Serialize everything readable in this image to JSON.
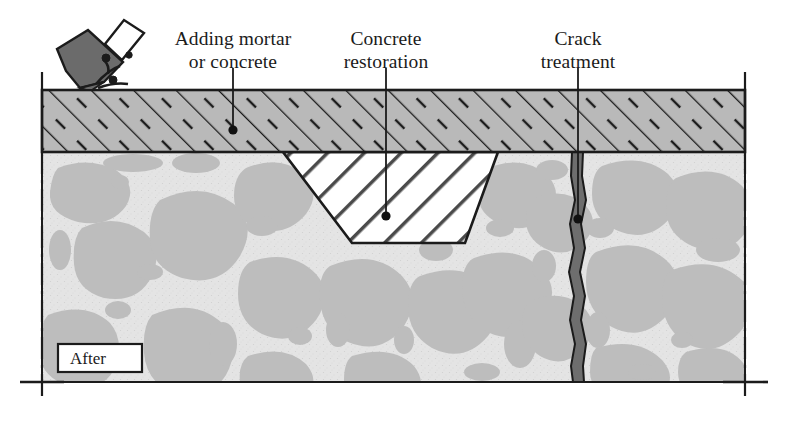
{
  "figure": {
    "stage_width": 787,
    "stage_height": 421
  },
  "labels": {
    "mortar": {
      "line1": "Adding mortar",
      "line2": "or concrete"
    },
    "restoration": {
      "line1": "Concrete",
      "line2": "restoration"
    },
    "crack": {
      "line1": "Crack",
      "line2": "treatment"
    },
    "stage_badge": "After"
  },
  "colors": {
    "outline": "#1b1b1b",
    "mortar_fill": "#b9b9b9",
    "concrete_matrix": "#e2e2e2",
    "aggregate": "#bdbdbd",
    "patch_fill": "#ffffff",
    "patch_hatch": "#4a4a4a",
    "crack_fill": "#6e6e6e",
    "tool_head": "#6b6b6b",
    "tool_handle": "#ffffff",
    "badge_bg": "#ffffff"
  },
  "geometry": {
    "section_left": 42,
    "section_right": 745,
    "surface_y": 90,
    "mortar_bottom_y": 152,
    "base_bottom_y": 382,
    "patch_top_left_x": 283,
    "patch_top_right_x": 498,
    "patch_bottom_left_x": 352,
    "patch_bottom_right_x": 465,
    "patch_bottom_y": 243,
    "crack_center_x": 578
  },
  "leaders": [
    {
      "name": "mortar",
      "x": 233,
      "y_end": 130
    },
    {
      "name": "restoration",
      "x": 386,
      "y_end": 216
    },
    {
      "name": "crack",
      "x": 578,
      "y_end": 219
    }
  ],
  "icons": {
    "chisel": "chisel-tool-icon",
    "debris": "debris-particles-icon"
  }
}
